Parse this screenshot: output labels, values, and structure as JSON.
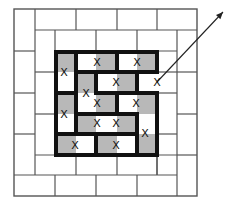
{
  "canvas": {
    "width": 234,
    "height": 204,
    "background": "#ffffff"
  },
  "colors": {
    "thin_line": "#555555",
    "thick_line": "#111111",
    "shade": "#b8b8b8",
    "mark": "#111111",
    "arrow": "#222222"
  },
  "grid": {
    "cols_x": [
      14,
      35,
      55,
      76,
      96,
      117,
      137,
      157,
      177,
      197
    ],
    "rows_y": [
      9,
      30,
      51,
      72,
      93,
      114,
      134,
      155,
      175,
      196
    ],
    "size": "9x9"
  },
  "outer_border": {
    "x1": 14,
    "y1": 9,
    "x2": 197,
    "y2": 196
  },
  "thin_lines": [
    [
      35,
      9,
      35,
      175
    ],
    [
      14,
      51,
      35,
      51
    ],
    [
      14,
      93,
      35,
      93
    ],
    [
      14,
      134,
      35,
      134
    ],
    [
      14,
      175,
      177,
      175
    ],
    [
      35,
      30,
      197,
      30
    ],
    [
      76,
      9,
      76,
      30
    ],
    [
      117,
      9,
      117,
      30
    ],
    [
      157,
      9,
      157,
      30
    ],
    [
      177,
      30,
      177,
      196
    ],
    [
      177,
      72,
      197,
      72
    ],
    [
      177,
      114,
      197,
      114
    ],
    [
      177,
      155,
      197,
      155
    ],
    [
      55,
      175,
      55,
      196
    ],
    [
      96,
      175,
      96,
      196
    ],
    [
      137,
      175,
      137,
      196
    ],
    [
      55,
      30,
      55,
      155
    ],
    [
      35,
      72,
      55,
      72
    ],
    [
      35,
      114,
      55,
      114
    ],
    [
      35,
      155,
      177,
      155
    ],
    [
      55,
      51,
      177,
      51
    ],
    [
      96,
      30,
      96,
      51
    ],
    [
      137,
      30,
      137,
      51
    ],
    [
      157,
      51,
      157,
      72
    ],
    [
      157,
      93,
      157,
      175
    ],
    [
      157,
      72,
      177,
      72
    ],
    [
      157,
      93,
      177,
      93
    ],
    [
      157,
      134,
      177,
      134
    ],
    [
      76,
      155,
      76,
      175
    ],
    [
      117,
      155,
      117,
      175
    ],
    [
      157,
      155,
      157,
      175
    ]
  ],
  "thick_lines": [
    [
      56,
      52,
      157,
      52
    ],
    [
      56,
      52,
      56,
      155
    ],
    [
      56,
      155,
      157,
      155
    ],
    [
      157,
      52,
      157,
      72
    ],
    [
      157,
      93,
      157,
      155
    ],
    [
      137,
      72,
      157,
      72
    ],
    [
      137,
      93,
      157,
      93
    ],
    [
      76,
      52,
      76,
      134
    ],
    [
      56,
      93,
      76,
      93
    ],
    [
      56,
      134,
      137,
      134
    ],
    [
      76,
      72,
      137,
      72
    ],
    [
      117,
      52,
      117,
      72
    ],
    [
      96,
      72,
      96,
      93
    ],
    [
      137,
      72,
      137,
      93
    ],
    [
      96,
      93,
      137,
      93
    ],
    [
      117,
      93,
      117,
      114
    ],
    [
      76,
      114,
      137,
      114
    ],
    [
      137,
      114,
      137,
      155
    ],
    [
      96,
      134,
      96,
      155
    ]
  ],
  "shaded_cells": [
    {
      "r": 2,
      "c": 2
    },
    {
      "r": 2,
      "c": 4
    },
    {
      "r": 2,
      "c": 6
    },
    {
      "r": 3,
      "c": 3
    },
    {
      "r": 3,
      "c": 5
    },
    {
      "r": 4,
      "c": 2
    },
    {
      "r": 4,
      "c": 4
    },
    {
      "r": 4,
      "c": 6
    },
    {
      "r": 5,
      "c": 3
    },
    {
      "r": 5,
      "c": 5
    },
    {
      "r": 6,
      "c": 2
    },
    {
      "r": 6,
      "c": 4
    },
    {
      "r": 6,
      "c": 6
    }
  ],
  "marks": {
    "label": "X",
    "positions": [
      [
        97,
        62
      ],
      [
        137,
        62
      ],
      [
        64,
        72
      ],
      [
        116,
        82
      ],
      [
        157,
        82
      ],
      [
        86,
        93
      ],
      [
        97,
        103
      ],
      [
        136,
        103
      ],
      [
        64,
        114
      ],
      [
        97,
        123
      ],
      [
        116,
        123
      ],
      [
        145,
        133
      ],
      [
        75,
        145
      ],
      [
        116,
        145
      ]
    ]
  },
  "arrow": {
    "from": [
      157,
      82
    ],
    "to": [
      223,
      12
    ]
  }
}
